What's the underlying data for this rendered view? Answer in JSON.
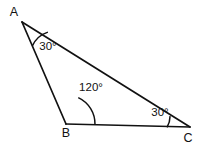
{
  "figure": {
    "type": "geometry-diagram",
    "shape": "triangle",
    "background_color": "#ffffff",
    "stroke_color": "#111111",
    "width": 199,
    "height": 147
  },
  "vertices": [
    {
      "name": "A",
      "label": "A",
      "x": 22,
      "y": 22,
      "label_x": 14,
      "label_y": 16
    },
    {
      "name": "B",
      "label": "B",
      "x": 66,
      "y": 124,
      "label_x": 66,
      "label_y": 137
    },
    {
      "name": "C",
      "label": "C",
      "x": 190,
      "y": 127,
      "label_x": 188,
      "label_y": 142
    }
  ],
  "edges": [
    {
      "name": "AB",
      "from": "A",
      "to": "B"
    },
    {
      "name": "BC",
      "from": "B",
      "to": "C"
    },
    {
      "name": "AC",
      "from": "A",
      "to": "C"
    }
  ],
  "angles": [
    {
      "at": "A",
      "label": "30°",
      "value": 30,
      "unit": "degrees",
      "label_x": 48,
      "label_y": 50,
      "arc_radius": 26
    },
    {
      "at": "B",
      "label": "120°",
      "value": 120,
      "unit": "degrees",
      "label_x": 91,
      "label_y": 91,
      "arc_radius": 29
    },
    {
      "at": "C",
      "label": "30°",
      "value": 30,
      "unit": "degrees",
      "label_x": 160,
      "label_y": 116,
      "arc_radius": 23
    }
  ],
  "paths": {
    "edge_AB": "M 22 22 L 66 124",
    "edge_BC": "M 66 124 L 190 127",
    "edge_AC": "M 22 22 L 190 127",
    "arc_A": "M 32.36 45.82 A 26 26 0 0 1 47.90 32.10",
    "arc_B": "M 78.25 97.62 A 29 29 0 0 1 95.00 124.70",
    "arc_C": "M 167.00 127.45 A 23 23 0 0 0 170.08 116.13"
  }
}
